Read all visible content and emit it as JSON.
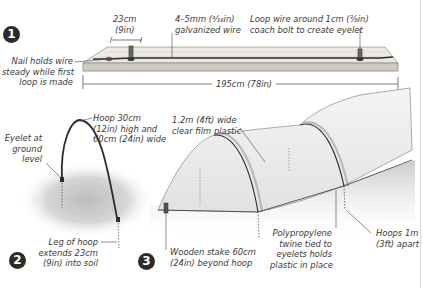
{
  "steps": [
    {
      "number": "1",
      "labels": {
        "spacing": [
          "23cm",
          "(9in)"
        ],
        "wire": [
          "4–5mm (³⁄₁₆in)",
          "galvanized wire"
        ],
        "bolt": [
          "Loop wire around 1cm (⅜in)",
          "coach bolt to create eyelet"
        ],
        "nail": [
          "Nail holds wire",
          "steady while first",
          "loop is made"
        ],
        "length": "195cm (78in)"
      }
    },
    {
      "number": "2",
      "labels": {
        "hoop": [
          "Hoop 30cm",
          "(12in) high and",
          "60cm (24in) wide"
        ],
        "eyelet": [
          "Eyelet at",
          "ground",
          "level"
        ],
        "leg": [
          "Leg of hoop",
          "extends 23cm",
          "(9in) into soil"
        ]
      }
    },
    {
      "number": "3",
      "labels": {
        "film": [
          "1.2m (4ft) wide",
          "clear film plastic"
        ],
        "stake": [
          "Wooden stake 60cm",
          "(24in) beyond hoop"
        ],
        "twine": [
          "Polypropylene",
          "twine tied to",
          "eyelets holds",
          "plastic in place"
        ],
        "spacing": [
          "Hoops 1m",
          "(3ft) apart"
        ]
      }
    }
  ],
  "colors": {
    "ink": "#2b2b2b",
    "board": "#e9e6df",
    "board_edge": "#b9b5ab",
    "soil": "#cfcfcf",
    "badge": "#2b2b2b"
  }
}
